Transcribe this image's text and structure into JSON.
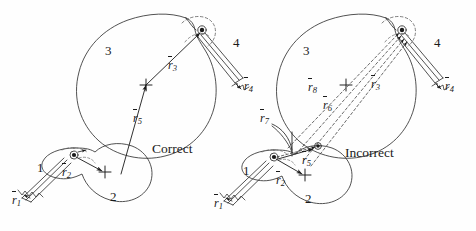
{
  "figure": {
    "background_color": "#fefefe",
    "ink_color": "#1a1a1a",
    "panels": [
      {
        "id": "left-panel",
        "caption": "Correct",
        "caption_pos": [
          152,
          148
        ],
        "body_labels": [
          {
            "name": "body-3",
            "text": "3",
            "pos": [
              105,
              50
            ]
          },
          {
            "name": "body-4",
            "text": "4",
            "pos": [
              233,
              42
            ]
          },
          {
            "name": "body-1",
            "text": "1",
            "pos": [
              37,
              167
            ]
          },
          {
            "name": "body-2",
            "text": "2",
            "pos": [
              110,
              196
            ]
          }
        ],
        "vectors": [
          {
            "name": "r1",
            "symbol": "r",
            "subscript": "1",
            "pos": [
              12,
              200
            ]
          },
          {
            "name": "r2",
            "symbol": "r",
            "subscript": "2",
            "pos": [
              62,
              172
            ]
          },
          {
            "name": "r3",
            "symbol": "r",
            "subscript": "3",
            "pos": [
              168,
              65
            ]
          },
          {
            "name": "r4",
            "symbol": "r",
            "subscript": "4",
            "pos": [
              244,
              86
            ]
          },
          {
            "name": "r5",
            "symbol": "r",
            "subscript": "5",
            "pos": [
              135,
              118
            ]
          }
        ]
      },
      {
        "id": "right-panel",
        "caption": "Incorrect",
        "caption_pos": [
          345,
          152
        ],
        "body_labels": [
          {
            "name": "body-3",
            "text": "3",
            "pos": [
              303,
              50
            ]
          },
          {
            "name": "body-4",
            "text": "4",
            "pos": [
              434,
              42
            ]
          },
          {
            "name": "body-1",
            "text": "1",
            "pos": [
              243,
              170
            ]
          },
          {
            "name": "body-2",
            "text": "2",
            "pos": [
              305,
              198
            ]
          }
        ],
        "vectors": [
          {
            "name": "r1",
            "symbol": "r",
            "subscript": "1",
            "pos": [
              216,
              202
            ]
          },
          {
            "name": "r2",
            "symbol": "r",
            "subscript": "2",
            "pos": [
              279,
              180
            ]
          },
          {
            "name": "r3",
            "symbol": "r",
            "subscript": "3",
            "pos": [
              373,
              84
            ]
          },
          {
            "name": "r4",
            "symbol": "r",
            "subscript": "4",
            "pos": [
              445,
              86
            ]
          },
          {
            "name": "r5",
            "symbol": "r",
            "subscript": "5",
            "pos": [
              304,
              160
            ]
          },
          {
            "name": "r6",
            "symbol": "r",
            "subscript": "6",
            "pos": [
              325,
              105
            ]
          },
          {
            "name": "r7",
            "symbol": "r",
            "subscript": "7",
            "pos": [
              262,
              118
            ]
          },
          {
            "name": "r8",
            "symbol": "r",
            "subscript": "8",
            "pos": [
              310,
              87
            ]
          }
        ]
      }
    ],
    "legend_note": {
      "solid_lines": "correct vector loop closure",
      "dashed_lines": "incorrect / redundant vector definitions"
    }
  }
}
